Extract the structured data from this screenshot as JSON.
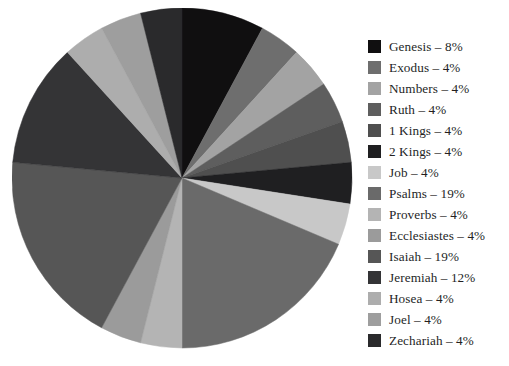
{
  "chart_data": {
    "type": "pie",
    "title": "",
    "subtitle": "",
    "xlabel": "",
    "ylabel": "",
    "grid": false,
    "legend_position": "right",
    "start_angle_deg": 0,
    "direction": "clockwise",
    "value_unit": "%",
    "separator": "–",
    "categories": [
      "Genesis",
      "Exodus",
      "Numbers",
      "Ruth",
      "1 Kings",
      "2 Kings",
      "Job",
      "Psalms",
      "Proverbs",
      "Ecclesiastes",
      "Isaiah",
      "Jeremiah",
      "Hosea",
      "Joel",
      "Zechariah"
    ],
    "values": [
      8,
      4,
      4,
      4,
      4,
      4,
      4,
      19,
      4,
      4,
      19,
      12,
      4,
      4,
      4
    ],
    "colors": [
      "#100f10",
      "#6e6e6e",
      "#a3a3a3",
      "#5e5e5e",
      "#4f4f4f",
      "#1f1f21",
      "#c8c8c8",
      "#6a6a6a",
      "#b4b4b4",
      "#9b9b9b",
      "#565656",
      "#343436",
      "#adadad",
      "#9e9e9e",
      "#2a2a2c"
    ],
    "slices": [
      {
        "label": "Genesis",
        "value": 8,
        "text": "Genesis – 8%",
        "color": "#100f10"
      },
      {
        "label": "Exodus",
        "value": 4,
        "text": "Exodus – 4%",
        "color": "#6e6e6e"
      },
      {
        "label": "Numbers",
        "value": 4,
        "text": "Numbers – 4%",
        "color": "#a3a3a3"
      },
      {
        "label": "Ruth",
        "value": 4,
        "text": "Ruth – 4%",
        "color": "#5e5e5e"
      },
      {
        "label": "1 Kings",
        "value": 4,
        "text": "1 Kings – 4%",
        "color": "#4f4f4f"
      },
      {
        "label": "2 Kings",
        "value": 4,
        "text": "2 Kings – 4%",
        "color": "#1f1f21"
      },
      {
        "label": "Job",
        "value": 4,
        "text": "Job – 4%",
        "color": "#c8c8c8"
      },
      {
        "label": "Psalms",
        "value": 19,
        "text": "Psalms – 19%",
        "color": "#6a6a6a"
      },
      {
        "label": "Proverbs",
        "value": 4,
        "text": "Proverbs – 4%",
        "color": "#b4b4b4"
      },
      {
        "label": "Ecclesiastes",
        "value": 4,
        "text": "Ecclesiastes – 4%",
        "color": "#9b9b9b"
      },
      {
        "label": "Isaiah",
        "value": 19,
        "text": "Isaiah – 19%",
        "color": "#565656"
      },
      {
        "label": "Jeremiah",
        "value": 12,
        "text": "Jeremiah – 12%",
        "color": "#343436"
      },
      {
        "label": "Hosea",
        "value": 4,
        "text": "Hosea – 4%",
        "color": "#adadad"
      },
      {
        "label": "Joel",
        "value": 4,
        "text": "Joel – 4%",
        "color": "#9e9e9e"
      },
      {
        "label": "Zechariah",
        "value": 4,
        "text": "Zechariah – 4%",
        "color": "#2a2a2c"
      }
    ]
  },
  "legend": {
    "items": [
      {
        "text": "Genesis – 8%",
        "color": "#100f10"
      },
      {
        "text": "Exodus – 4%",
        "color": "#6e6e6e"
      },
      {
        "text": "Numbers – 4%",
        "color": "#a3a3a3"
      },
      {
        "text": "Ruth – 4%",
        "color": "#5e5e5e"
      },
      {
        "text": "1 Kings – 4%",
        "color": "#4f4f4f"
      },
      {
        "text": "2 Kings – 4%",
        "color": "#1f1f21"
      },
      {
        "text": "Job – 4%",
        "color": "#c8c8c8"
      },
      {
        "text": "Psalms – 19%",
        "color": "#6a6a6a"
      },
      {
        "text": "Proverbs – 4%",
        "color": "#b4b4b4"
      },
      {
        "text": "Ecclesiastes – 4%",
        "color": "#9b9b9b"
      },
      {
        "text": "Isaiah – 19%",
        "color": "#565656"
      },
      {
        "text": "Jeremiah – 12%",
        "color": "#343436"
      },
      {
        "text": "Hosea – 4%",
        "color": "#adadad"
      },
      {
        "text": "Joel – 4%",
        "color": "#9e9e9e"
      },
      {
        "text": "Zechariah – 4%",
        "color": "#2a2a2c"
      }
    ]
  },
  "figure": {
    "background": "#ffffff",
    "text_color": "#241f1f",
    "pie": {
      "center_x": 170,
      "center_y": 170,
      "radius": 170
    }
  }
}
